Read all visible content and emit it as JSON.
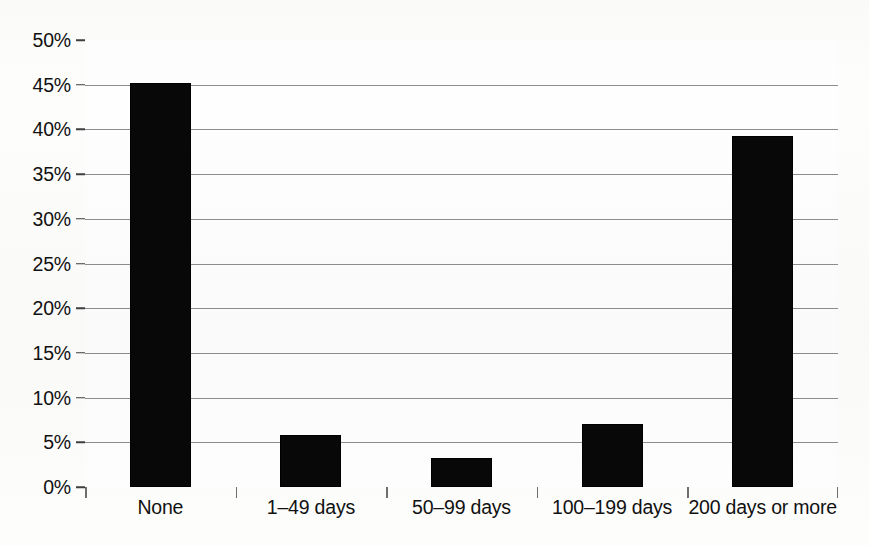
{
  "chart_data": {
    "type": "bar",
    "title": "",
    "subtitle": "",
    "xlabel": "",
    "ylabel": "",
    "categories": [
      "None",
      "1–49 days",
      "50–99 days",
      "100–199 days",
      "200 days or more"
    ],
    "values": [
      45.2,
      5.8,
      3.2,
      7.0,
      39.3
    ],
    "value_format": "percent",
    "ylim": [
      0,
      50
    ],
    "ytick_step": 5,
    "ytick_labels": [
      "0%",
      "5%",
      "10%",
      "15%",
      "20%",
      "25%",
      "30%",
      "35%",
      "40%",
      "45%",
      "50%"
    ],
    "ytick_values": [
      0,
      5,
      10,
      15,
      20,
      25,
      30,
      35,
      40,
      45,
      50
    ],
    "grid": true,
    "grid_axis": "y",
    "legend": false,
    "legend_position": "none",
    "annotations": [],
    "series": [
      {
        "name": "Share of respondents",
        "values": [
          45.2,
          5.8,
          3.2,
          7.0,
          39.3
        ],
        "color": "#080808"
      }
    ],
    "colors": {
      "bar": "#080808",
      "gridline": "#8d8d8d",
      "axis": "#4a4a4a",
      "text": "#111111",
      "background": "#fdfdfc"
    }
  }
}
